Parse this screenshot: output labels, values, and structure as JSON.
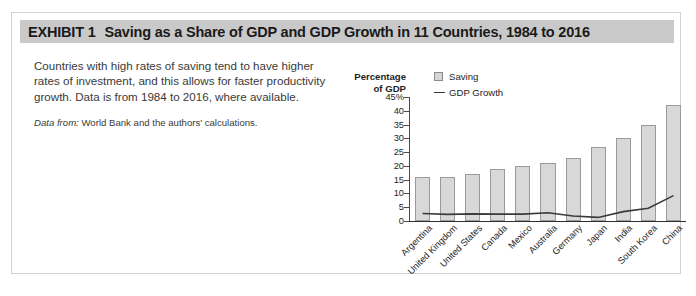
{
  "exhibit": {
    "number_label": "EXHIBIT 1",
    "title": "Saving as a Share of GDP and GDP Growth in 11 Countries, 1984 to 2016"
  },
  "description": {
    "body": "Countries with high rates of saving tend to have higher rates of investment, and this allows for faster productivity growth. Data is from 1984 to 2016, where available.",
    "source_label": "Data from:",
    "source_text": "World Bank and the authors' calculations."
  },
  "chart_data": {
    "type": "bar",
    "title": "",
    "xlabel": "",
    "ylabel": "Percentage of GDP",
    "ylabel_line1": "Percentage",
    "ylabel_line2": "of GDP",
    "ylim": [
      0,
      45
    ],
    "ytick_labels": [
      "45%",
      "40",
      "35",
      "30",
      "25",
      "20",
      "15",
      "10",
      "5",
      "0"
    ],
    "ytick_values": [
      45,
      40,
      35,
      30,
      25,
      20,
      15,
      10,
      5,
      0
    ],
    "grid": false,
    "legend_position": "top-right",
    "legend": [
      {
        "name": "Saving",
        "type": "bar",
        "color": "#d8d8d8"
      },
      {
        "name": "GDP Growth",
        "type": "line",
        "color": "#3a3a3a"
      }
    ],
    "categories": [
      "Argentina",
      "United Kingdom",
      "United States",
      "Canada",
      "Mexico",
      "Australia",
      "Germany",
      "Japan",
      "India",
      "South Korea",
      "China"
    ],
    "series": [
      {
        "name": "Saving",
        "type": "bar",
        "values": [
          16,
          16,
          17,
          19,
          20,
          21,
          23,
          27,
          30,
          35,
          42
        ]
      },
      {
        "name": "GDP Growth",
        "type": "line",
        "values": [
          2.7,
          2.4,
          2.6,
          2.5,
          2.5,
          3.0,
          1.8,
          1.3,
          3.4,
          4.6,
          9.2
        ]
      }
    ]
  },
  "colors": {
    "header_band": "#c9c9c9",
    "frame_border": "#d2d2d2",
    "bar_fill": "#d8d8d8",
    "bar_stroke": "#9a9a9a",
    "line": "#3a3a3a",
    "axis": "#2e2e2e",
    "text": "#1e1e1e"
  }
}
